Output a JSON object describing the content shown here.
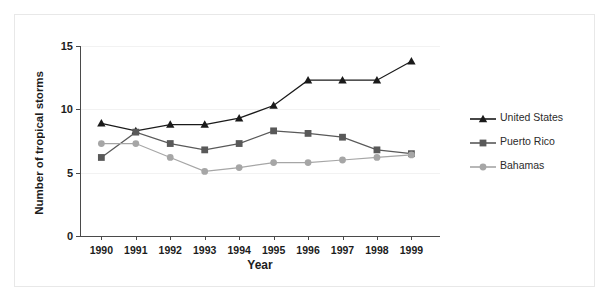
{
  "chart_data": {
    "type": "line",
    "title": "",
    "xlabel": "Year",
    "ylabel": "Number of tropical storms",
    "categories": [
      "1990",
      "1991",
      "1992",
      "1993",
      "1994",
      "1995",
      "1996",
      "1997",
      "1998",
      "1999"
    ],
    "x": [
      1990,
      1991,
      1992,
      1993,
      1994,
      1995,
      1996,
      1997,
      1998,
      1999
    ],
    "ylim": [
      0,
      15
    ],
    "yticks": [
      0,
      5,
      10,
      15
    ],
    "ytick_labels": [
      "0",
      "5",
      "10",
      "15"
    ],
    "grid": true,
    "legend_position": "right",
    "series": [
      {
        "name": "United States",
        "color": "#1a1a1a",
        "marker": "triangle",
        "values": [
          8.9,
          8.3,
          8.8,
          8.8,
          9.3,
          10.3,
          12.3,
          12.3,
          12.3,
          13.8
        ]
      },
      {
        "name": "Puerto Rico",
        "color": "#595959",
        "marker": "square",
        "values": [
          6.2,
          8.2,
          7.3,
          6.8,
          7.3,
          8.3,
          8.1,
          7.8,
          6.8,
          6.5
        ]
      },
      {
        "name": "Bahamas",
        "color": "#a6a6a6",
        "marker": "circle",
        "values": [
          7.3,
          7.3,
          6.2,
          5.1,
          5.4,
          5.8,
          5.8,
          6.0,
          6.2,
          6.4
        ]
      }
    ]
  },
  "axes": {
    "y_title": "Number of tropical storms",
    "x_title": "Year"
  },
  "legend": {
    "items": [
      {
        "label": "United States"
      },
      {
        "label": "Puerto Rico"
      },
      {
        "label": "Bahamas"
      }
    ]
  }
}
